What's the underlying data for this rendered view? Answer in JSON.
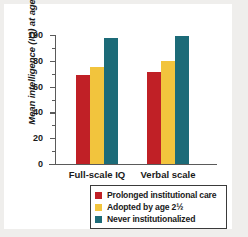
{
  "chart_data": {
    "type": "bar",
    "title": "",
    "xlabel": "",
    "ylabel": "Mean intelligence (IQ) at age 12",
    "ylim": [
      0,
      100
    ],
    "ytick_labels": [
      "0",
      "20",
      "40",
      "60",
      "80",
      "100"
    ],
    "ytick_values": [
      0,
      20,
      40,
      60,
      80,
      100
    ],
    "minor_tick_values": [
      10,
      30,
      50,
      70,
      90
    ],
    "grid": false,
    "legend_position": "bottom-right",
    "categories": [
      "Full-scale IQ",
      "Verbal scale"
    ],
    "series": [
      {
        "name": "Prolonged institutional care",
        "color": "#C02026",
        "values": [
          69,
          71
        ]
      },
      {
        "name": "Adopted by age 2½",
        "color": "#F2C43D",
        "values": [
          75,
          80
        ]
      },
      {
        "name": "Never institutionalized",
        "color": "#1C6B78",
        "values": [
          98,
          99
        ]
      }
    ]
  },
  "legend": {
    "items": [
      {
        "label": "Prolonged institutional care",
        "color": "#C02026"
      },
      {
        "label": "Adopted by age 2½",
        "color": "#F2C43D"
      },
      {
        "label": "Never institutionalized",
        "color": "#1C6B78"
      }
    ]
  },
  "colors": {
    "figure_background": "#efeeec",
    "plot_background": "#ffffff",
    "axis": "#5a5a5a",
    "text": "#1a1a1a",
    "legend_border": "#3a3a3a"
  }
}
